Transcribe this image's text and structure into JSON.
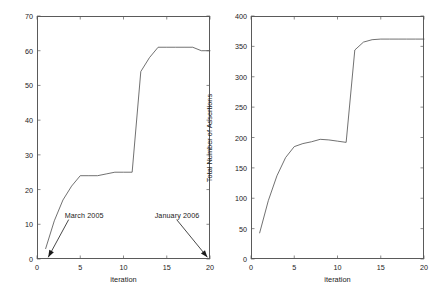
{
  "figure": {
    "background": "#ffffff",
    "line_color": "#4d4d4d",
    "axis_color": "#5a5a5a",
    "text_color": "#1a1a1a"
  },
  "panels": [
    {
      "id": "left",
      "name": "test-cases-panel",
      "ylabel": "Total Number of Test Cases",
      "xlabel": "iteration",
      "yticks": [
        "0",
        "10",
        "20",
        "30",
        "40",
        "50",
        "60",
        "70"
      ],
      "xticks": [
        "0",
        "5",
        "10",
        "15",
        "20"
      ],
      "annotations": [
        {
          "text": "March 2005",
          "name": "march-2005-annotation"
        },
        {
          "text": "January 2006",
          "name": "january-2006-annotation"
        }
      ]
    },
    {
      "id": "right",
      "name": "assertions-panel",
      "ylabel": "Total Number of Assertions",
      "xlabel": "iteration",
      "yticks": [
        "0",
        "50",
        "100",
        "150",
        "200",
        "250",
        "300",
        "350",
        "400"
      ],
      "xticks": [
        "0",
        "5",
        "10",
        "15",
        "20"
      ],
      "annotations": []
    }
  ],
  "chart_data": [
    {
      "type": "line",
      "title": "",
      "xlabel": "iteration",
      "ylabel": "Total Number of Test Cases",
      "xlim": [
        0,
        20
      ],
      "ylim": [
        0,
        70
      ],
      "xticks": [
        0,
        5,
        10,
        15,
        20
      ],
      "yticks": [
        0,
        10,
        20,
        30,
        40,
        50,
        60,
        70
      ],
      "grid": false,
      "legend": null,
      "series": [
        {
          "name": "Total Number of Test Cases",
          "x": [
            1,
            2,
            3,
            4,
            5,
            6,
            7,
            8,
            9,
            10,
            11,
            12,
            13,
            14,
            15,
            16,
            17,
            18,
            19,
            20
          ],
          "values": [
            3,
            11,
            17,
            21,
            24,
            24,
            24,
            24.5,
            25,
            25,
            25,
            54,
            58,
            61,
            61,
            61,
            61,
            61,
            60,
            60
          ]
        }
      ],
      "annotations": [
        {
          "text": "March 2005",
          "point_x": 1.3,
          "point_y": 0.5,
          "label_x": 3.2,
          "label_y": 12.5
        },
        {
          "text": "January 2006",
          "point_x": 19.7,
          "point_y": 0.5,
          "label_x": 13.6,
          "label_y": 12.5
        }
      ]
    },
    {
      "type": "line",
      "title": "",
      "xlabel": "iteration",
      "ylabel": "Total Number of Assertions",
      "xlim": [
        0,
        20
      ],
      "ylim": [
        0,
        400
      ],
      "xticks": [
        0,
        5,
        10,
        15,
        20
      ],
      "yticks": [
        0,
        50,
        100,
        150,
        200,
        250,
        300,
        350,
        400
      ],
      "grid": false,
      "legend": null,
      "series": [
        {
          "name": "Total Number of Assertions",
          "x": [
            1,
            2,
            3,
            4,
            5,
            6,
            7,
            8,
            9,
            10,
            11,
            12,
            13,
            14,
            15,
            16,
            17,
            18,
            19,
            20
          ],
          "values": [
            43,
            96,
            137,
            167,
            185,
            190,
            193,
            197,
            196,
            194,
            192,
            344,
            357,
            361,
            362,
            362,
            362,
            362,
            362,
            362
          ]
        }
      ],
      "annotations": []
    }
  ]
}
